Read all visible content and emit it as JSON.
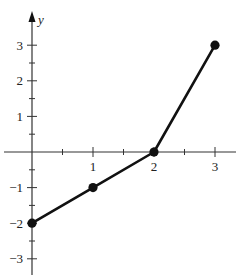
{
  "chart_data": {
    "type": "line",
    "title": "",
    "xlabel": "",
    "ylabel": "y",
    "x": [
      0,
      1,
      2,
      3
    ],
    "series": [
      {
        "name": "f",
        "values": [
          -2,
          -1,
          0,
          3
        ]
      }
    ],
    "points": [
      [
        0,
        -2
      ],
      [
        1,
        -1
      ],
      [
        2,
        0
      ],
      [
        3,
        3
      ]
    ],
    "xlim": [
      -0.5,
      3.4
    ],
    "ylim": [
      -3.3,
      3.6
    ],
    "x_ticks": [
      1,
      2,
      3
    ],
    "y_ticks": [
      3,
      2,
      1,
      -1,
      -2,
      -3
    ],
    "x_tick_labels": [
      "1",
      "2",
      "3"
    ],
    "y_tick_labels": [
      "3",
      "2",
      "1",
      "−1",
      "−2",
      "−3"
    ],
    "minor_ticks": "every 0.5",
    "grid": false,
    "legend": "none"
  },
  "axes": {
    "y_axis_label": "y"
  },
  "colors": {
    "line": "#111111",
    "axis": "#333333"
  }
}
